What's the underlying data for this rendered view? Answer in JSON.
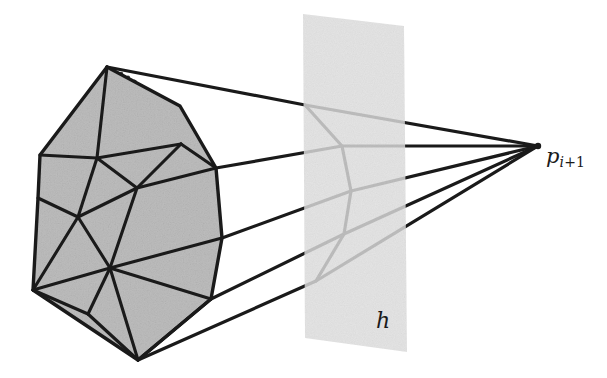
{
  "figure": {
    "type": "geometric-diagram",
    "background_color": "#ffffff",
    "width": 607,
    "height": 378
  },
  "labels": {
    "apex_point": {
      "base": "p",
      "subscript": "i+1",
      "subscript_italic_part": "i",
      "subscript_plain_part": "+1",
      "x": 546,
      "y": 146
    },
    "hyperplane": {
      "text": "h",
      "x": 376,
      "y": 310
    }
  },
  "colors": {
    "stroke": "#1a1a1a",
    "polytope_fill": "#bdbdbd",
    "cone_fill": "#ffffff",
    "hyperplane_fill": "#dedede",
    "hyperplane_stroke": "none",
    "hidden_edge": "#4d4d4d"
  },
  "geometry": {
    "apex": {
      "x": 538,
      "y": 146
    },
    "hyperplane_polygon": [
      {
        "x": 303,
        "y": 14
      },
      {
        "x": 404,
        "y": 26
      },
      {
        "x": 407,
        "y": 352
      },
      {
        "x": 305,
        "y": 338
      }
    ],
    "polytope_silhouette": [
      {
        "x": 107,
        "y": 67
      },
      {
        "x": 40,
        "y": 155
      },
      {
        "x": 38,
        "y": 198
      },
      {
        "x": 33,
        "y": 290
      },
      {
        "x": 138,
        "y": 360
      },
      {
        "x": 211,
        "y": 299
      },
      {
        "x": 222,
        "y": 238
      },
      {
        "x": 216,
        "y": 168
      },
      {
        "x": 180,
        "y": 106
      }
    ],
    "polytope_interior_vertices": [
      {
        "name": "v-center-upper",
        "x": 97,
        "y": 158
      },
      {
        "name": "v-center-mid",
        "x": 137,
        "y": 188
      },
      {
        "name": "v-center-left",
        "x": 78,
        "y": 217
      },
      {
        "name": "v-center-lower",
        "x": 110,
        "y": 268
      },
      {
        "name": "v-edge-right-upper",
        "x": 181,
        "y": 144
      }
    ],
    "hidden_back_silhouette": [
      {
        "x": 107,
        "y": 67
      },
      {
        "x": 160,
        "y": 93
      },
      {
        "x": 186,
        "y": 128
      },
      {
        "x": 195,
        "y": 175
      },
      {
        "x": 204,
        "y": 220
      },
      {
        "x": 196,
        "y": 268
      },
      {
        "x": 165,
        "y": 318
      },
      {
        "x": 138,
        "y": 360
      }
    ],
    "cone_ruling_lines": [
      {
        "from": {
          "x": 107,
          "y": 67
        },
        "bend": {
          "x": 305,
          "y": 105
        },
        "to": {
          "x": 538,
          "y": 146
        }
      },
      {
        "from": {
          "x": 216,
          "y": 168
        },
        "bend": {
          "x": 342,
          "y": 146
        },
        "to": {
          "x": 538,
          "y": 146
        }
      },
      {
        "from": {
          "x": 222,
          "y": 238
        },
        "bend": {
          "x": 351,
          "y": 191
        },
        "to": {
          "x": 538,
          "y": 146
        }
      },
      {
        "from": {
          "x": 211,
          "y": 299
        },
        "bend": {
          "x": 344,
          "y": 234
        },
        "to": {
          "x": 538,
          "y": 146
        }
      },
      {
        "from": {
          "x": 138,
          "y": 360
        },
        "bend": {
          "x": 316,
          "y": 281
        },
        "to": {
          "x": 538,
          "y": 146
        }
      }
    ]
  }
}
